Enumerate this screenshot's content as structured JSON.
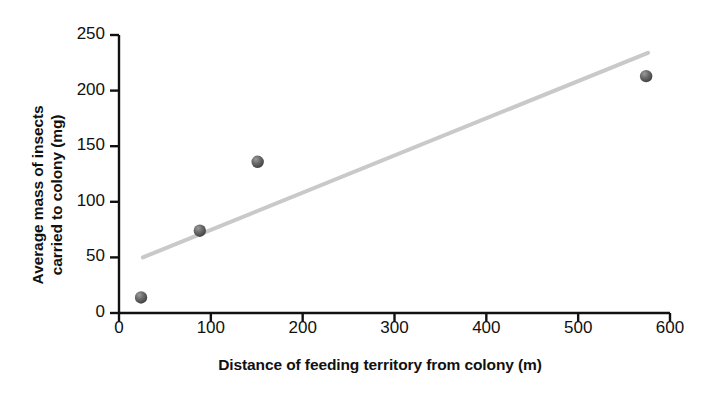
{
  "figure": {
    "top_partial_text": "",
    "background": "#ffffff"
  },
  "chart_data": {
    "type": "scatter",
    "title": "",
    "xlabel": "Distance of feeding territory from colony (m)",
    "ylabel": "Average mass of insects carried to colony (mg)",
    "ylabel_line1": "Average mass of insects",
    "ylabel_line2": "carried to colony (mg)",
    "xlim": [
      0,
      600
    ],
    "ylim": [
      0,
      250
    ],
    "xticks": [
      0,
      100,
      200,
      300,
      400,
      500,
      600
    ],
    "yticks": [
      0,
      50,
      100,
      150,
      200,
      250
    ],
    "xtick_labels": [
      "0",
      "100",
      "200",
      "300",
      "400",
      "500",
      "600"
    ],
    "ytick_labels": [
      "0",
      "50",
      "100",
      "150",
      "200",
      "250"
    ],
    "grid": false,
    "legend": false,
    "points": [
      {
        "x": 24,
        "y": 14
      },
      {
        "x": 88,
        "y": 74
      },
      {
        "x": 151,
        "y": 136
      },
      {
        "x": 574,
        "y": 213
      }
    ],
    "series": [
      {
        "name": "Average mass of insects carried to colony",
        "x": [
          24,
          88,
          151,
          574
        ],
        "values": [
          14,
          74,
          136,
          213
        ],
        "marker_color": "#555555"
      }
    ],
    "trendline": {
      "name": "line of best fit",
      "x_start": 26,
      "y_start": 50,
      "x_end": 576,
      "y_end": 234,
      "color": "#c9c9c9",
      "width": 4
    },
    "axis_color": "#111111"
  }
}
